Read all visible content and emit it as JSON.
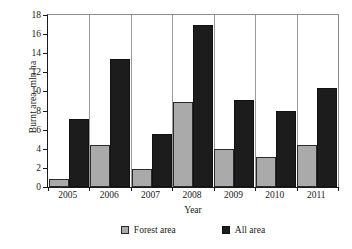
{
  "chart_data": {
    "type": "bar",
    "title": "",
    "xlabel": "Year",
    "ylabel": "Burnt area, mln ha",
    "categories": [
      "2005",
      "2006",
      "2007",
      "2008",
      "2009",
      "2010",
      "2011"
    ],
    "series": [
      {
        "name": "Forest area",
        "color": "#aaaaaa",
        "values": [
          0.8,
          4.4,
          1.9,
          8.9,
          4.0,
          3.1,
          4.4
        ]
      },
      {
        "name": "All area",
        "color": "#1c1c1c",
        "values": [
          7.1,
          13.4,
          5.5,
          17.0,
          9.1,
          8.0,
          10.4
        ]
      }
    ],
    "ylim": [
      0,
      18
    ],
    "yticks": [
      0,
      2,
      4,
      6,
      8,
      10,
      12,
      14,
      16,
      18
    ],
    "ytick_labels": [
      "0",
      "2",
      "4",
      "6",
      "8",
      "10",
      "12",
      "14",
      "16",
      "18"
    ],
    "grid": false,
    "group_separators": true,
    "legend_position": "bottom",
    "legend": [
      "Forest area",
      "All area"
    ]
  }
}
